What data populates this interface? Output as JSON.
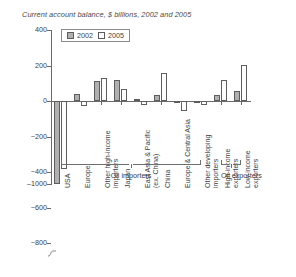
{
  "chart_data": {
    "type": "bar",
    "title": "Current account balance, $ billions, 2002 and 2005",
    "xlabel": "",
    "ylabel": "",
    "ylim": [
      -1000,
      400
    ],
    "yticks": [
      400,
      200,
      0,
      -200,
      -400,
      -600,
      -800,
      -1000
    ],
    "ytick_labels": [
      "400",
      "200",
      "0",
      "−200",
      "−400",
      "−600",
      "−800",
      "‒1000"
    ],
    "grid": false,
    "legend_position": "top-left",
    "axis_break_note": "y-axis broken between -800 and -1000",
    "categories": [
      "USA",
      "Europe",
      "Other high-income\nimporters",
      "Japan",
      "East Asia & Pacific\n(ex. China)",
      "China",
      "Europe & Central Asia",
      "Other developing\nimporters",
      "High-income\nexporters",
      "Low-income\nexporters"
    ],
    "series": [
      {
        "name": "2002",
        "color": "#b0b0b0",
        "values": [
          -470,
          40,
          110,
          120,
          10,
          35,
          -10,
          0,
          35,
          55
        ]
      },
      {
        "name": "2005",
        "color": "#fdfdfd",
        "values": [
          -800,
          -30,
          130,
          70,
          -25,
          160,
          -55,
          -20,
          120,
          205
        ]
      }
    ],
    "group_braces": [
      {
        "label": "Oil importers",
        "from": 0,
        "to": 7
      },
      {
        "label": "Oil exporters",
        "from": 8,
        "to": 9
      }
    ]
  },
  "legend": {
    "items": [
      {
        "label": "2002",
        "swatch": "filled-gray-swatch"
      },
      {
        "label": "2005",
        "swatch": "empty-white-swatch"
      }
    ]
  }
}
